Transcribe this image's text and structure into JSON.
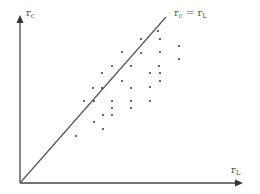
{
  "chart_data": {
    "type": "scatter",
    "title": "",
    "xlabel": "r_L",
    "ylabel": "r_c",
    "x_label_display": {
      "main": "r",
      "sub": "L"
    },
    "y_label_display": {
      "main": "r",
      "sub": "c"
    },
    "annotations": [
      {
        "text": "r_c = r_L",
        "main1": "r",
        "sub1": "c",
        "eq": " = ",
        "main2": "r",
        "sub2": "L",
        "type": "45-degree reference line"
      }
    ],
    "reference_line": {
      "from": [
        0,
        0
      ],
      "to": [
        1,
        1
      ],
      "label": "r_c = r_L"
    },
    "axes": {
      "x_ticks": [],
      "y_ticks": [],
      "grid": false,
      "arrows": true
    },
    "legend": null,
    "points_pixel": [
      [
        158,
        31
      ],
      [
        141,
        39
      ],
      [
        160,
        39
      ],
      [
        179,
        46
      ],
      [
        122,
        52
      ],
      [
        141,
        53
      ],
      [
        160,
        52
      ],
      [
        112,
        66
      ],
      [
        131,
        66
      ],
      [
        159,
        66
      ],
      [
        179,
        59
      ],
      [
        102,
        73
      ],
      [
        150,
        73
      ],
      [
        160,
        73
      ],
      [
        93,
        88
      ],
      [
        102,
        88
      ],
      [
        122,
        81
      ],
      [
        131,
        88
      ],
      [
        150,
        87
      ],
      [
        160,
        81
      ],
      [
        84,
        101
      ],
      [
        94,
        101
      ],
      [
        112,
        101
      ],
      [
        131,
        101
      ],
      [
        150,
        101
      ],
      [
        103,
        115
      ],
      [
        112,
        108
      ],
      [
        131,
        108
      ],
      [
        94,
        122
      ],
      [
        112,
        115
      ],
      [
        103,
        129
      ],
      [
        76,
        136
      ]
    ],
    "note": "Most points lie below/right of the 45-degree line r_c = r_L, i.e. r_L > r_c for the majority of observations"
  },
  "colors": {
    "axis": "#444444",
    "diagonal": "#555555",
    "point": "#444444",
    "label": "#555555"
  },
  "geometry": {
    "origin": [
      20,
      183
    ],
    "y_axis_top": [
      20,
      17
    ],
    "x_axis_right": [
      242,
      183
    ],
    "diagonal_end": [
      166,
      17
    ]
  }
}
